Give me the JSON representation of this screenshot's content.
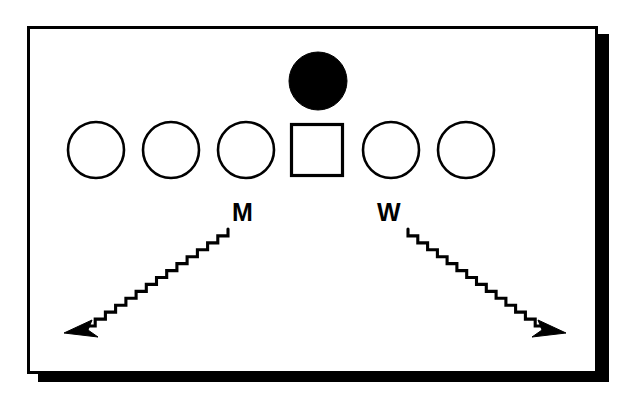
{
  "figure": {
    "title": "",
    "background_color": "#ffffff",
    "panel": {
      "fill_color": "#ffffff",
      "stroke_color": "#000000",
      "shadow_color": "#000000",
      "x": 27,
      "y": 26,
      "width": 571,
      "height": 348,
      "shadow_offset_x": 11,
      "shadow_offset_y": 8
    },
    "symbol_row": {
      "label": "sibship-row",
      "count": 6,
      "center_y": 150,
      "symbols": [
        {
          "index": 1,
          "type": "circle",
          "state": "open",
          "cx": 96,
          "cy": 150,
          "r": 28,
          "fill": "#ffffff"
        },
        {
          "index": 2,
          "type": "circle",
          "state": "open",
          "cx": 171,
          "cy": 150,
          "r": 28,
          "fill": "#ffffff"
        },
        {
          "index": 3,
          "type": "circle",
          "state": "open",
          "cx": 246,
          "cy": 150,
          "r": 28,
          "fill": "#ffffff"
        },
        {
          "index": 4,
          "type": "square",
          "state": "open",
          "cx": 317,
          "cy": 150,
          "size": 51,
          "fill": "#ffffff"
        },
        {
          "index": 5,
          "type": "circle",
          "state": "open",
          "cx": 391,
          "cy": 150,
          "r": 28,
          "fill": "#ffffff"
        },
        {
          "index": 6,
          "type": "circle",
          "state": "open",
          "cx": 466,
          "cy": 150,
          "r": 28,
          "fill": "#ffffff"
        }
      ]
    },
    "top_symbol": {
      "label": "filled-circle-top",
      "type": "circle",
      "state": "filled",
      "cx": 318,
      "cy": 81,
      "r": 29,
      "fill": "#000000"
    },
    "annotations": [
      {
        "id": "left",
        "letter": "M",
        "letter_x": 232,
        "letter_y": 200,
        "arrow": {
          "name": "zigzag-arrow-left",
          "direction": "down-left",
          "from_x": 228,
          "from_y": 229,
          "to_x": 67,
          "to_y": 332,
          "style": "zigzag",
          "stroke": "#000000"
        }
      },
      {
        "id": "right",
        "letter": "W",
        "letter_x": 377,
        "letter_y": 200,
        "arrow": {
          "name": "zigzag-arrow-right",
          "direction": "down-right",
          "from_x": 408,
          "from_y": 229,
          "to_x": 563,
          "to_y": 332,
          "style": "zigzag",
          "stroke": "#000000"
        }
      }
    ]
  }
}
